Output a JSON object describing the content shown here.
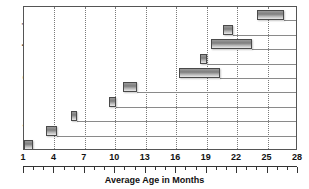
{
  "chart_data": {
    "type": "bar",
    "orientation": "horizontal",
    "title": "",
    "xlabel": "Average Age in Months",
    "ylabel": "Language Comprehension",
    "xlim": [
      1,
      28
    ],
    "xticks": [
      1,
      4,
      7,
      10,
      13,
      16,
      19,
      22,
      25,
      28
    ],
    "xticklabels": [
      "1",
      "4",
      "7",
      "10",
      "13",
      "16",
      "19",
      "22",
      "25",
      "28"
    ],
    "minor_tick_interval": 1,
    "grid": "vertical-dotted",
    "legend": "none",
    "bar_style": "range-bar-gradient",
    "rows": 10,
    "series": [
      {
        "name": "Language comprehension milestone age ranges",
        "ranges": [
          {
            "row": 1,
            "start": 24.0,
            "end": 26.6
          },
          {
            "row": 2,
            "start": 20.6,
            "end": 21.6
          },
          {
            "row": 3,
            "start": 19.4,
            "end": 23.5
          },
          {
            "row": 4,
            "start": 18.3,
            "end": 19.0
          },
          {
            "row": 5,
            "start": 16.3,
            "end": 20.3
          },
          {
            "row": 6,
            "start": 10.8,
            "end": 12.1
          },
          {
            "row": 7,
            "start": 9.4,
            "end": 10.1
          },
          {
            "row": 8,
            "start": 5.6,
            "end": 6.2
          },
          {
            "row": 9,
            "start": 3.2,
            "end": 4.3
          },
          {
            "row": 10,
            "start": 1.0,
            "end": 1.9
          }
        ]
      }
    ]
  },
  "axis": {
    "ylabel_text": "Language Comprehension",
    "xlabel_text": "Average Age in Months"
  }
}
